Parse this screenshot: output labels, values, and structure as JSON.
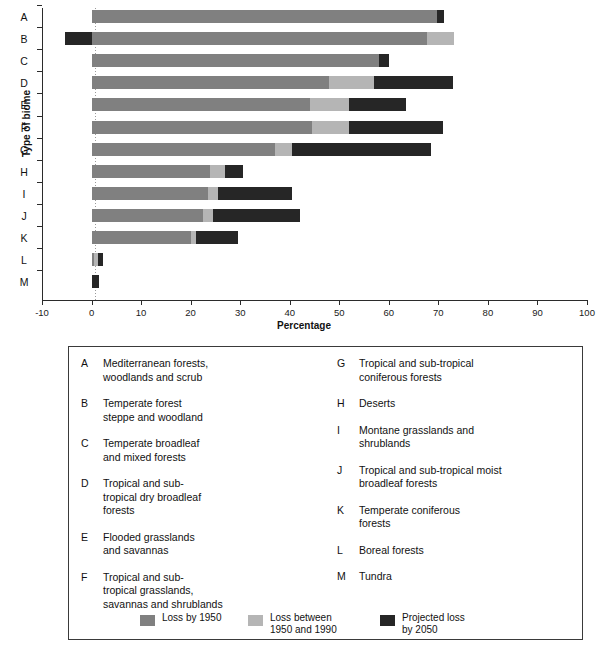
{
  "chart_data": {
    "type": "bar",
    "orientation": "horizontal",
    "stacked": true,
    "title": "",
    "xlabel": "Percentage",
    "ylabel": "Type of biome",
    "xlim": [
      -10,
      100
    ],
    "xticks": [
      -10,
      0,
      10,
      20,
      30,
      40,
      50,
      60,
      70,
      80,
      90,
      100
    ],
    "grid": false,
    "legend_position": "bottom",
    "categories": [
      "A",
      "B",
      "C",
      "D",
      "E",
      "F",
      "G",
      "H",
      "I",
      "J",
      "K",
      "L",
      "M"
    ],
    "series": [
      {
        "name": "Loss by 1950",
        "color": "#808080",
        "values": [
          69.8,
          67.8,
          58.0,
          48.0,
          44.0,
          44.5,
          37.0,
          24.0,
          23.5,
          22.5,
          20.0,
          0.5,
          0.0
        ]
      },
      {
        "name": "Loss between 1950 and 1990",
        "color": "#b5b5b5",
        "values": [
          0.0,
          5.4,
          0.0,
          9.0,
          8.0,
          7.5,
          3.5,
          3.0,
          2.0,
          2.0,
          1.0,
          0.8,
          0.0
        ]
      },
      {
        "name": "Projected loss by 2050",
        "color": "#262626",
        "values": [
          1.4,
          0.0,
          2.0,
          16.0,
          11.5,
          19.0,
          28.0,
          3.5,
          15.0,
          17.5,
          8.5,
          1.0,
          1.5
        ]
      }
    ],
    "negative_segments": [
      {
        "category": "B",
        "series": "Projected loss by 2050",
        "from": -5.3,
        "to": 0.0
      }
    ],
    "bar_totals": [
      71.2,
      73.2,
      60.0,
      73.0,
      63.5,
      71.0,
      68.5,
      30.5,
      40.5,
      42.0,
      29.5,
      2.3,
      1.5
    ]
  },
  "axis": {
    "ylabel": "Type of biome",
    "xlabel": "Percentage",
    "xticks": [
      "-10",
      "0",
      "10",
      "20",
      "30",
      "40",
      "50",
      "60",
      "70",
      "80",
      "90",
      "100"
    ],
    "ycategories": [
      "A",
      "B",
      "C",
      "D",
      "E",
      "F",
      "G",
      "H",
      "I",
      "J",
      "K",
      "L",
      "M"
    ]
  },
  "key": {
    "left_column": [
      {
        "letter": "A",
        "text": "Mediterranean forests,\nwoodlands and scrub"
      },
      {
        "letter": "B",
        "text": "Temperate forest\nsteppe and woodland"
      },
      {
        "letter": "C",
        "text": "Temperate broadleaf\nand mixed forests"
      },
      {
        "letter": "D",
        "text": "Tropical and sub-\ntropical dry broadleaf\nforests"
      },
      {
        "letter": "E",
        "text": "Flooded grasslands\nand savannas"
      },
      {
        "letter": "F",
        "text": "Tropical and sub-\ntropical grasslands,\nsavannas and shrublands"
      }
    ],
    "right_column": [
      {
        "letter": "G",
        "text": "Tropical and sub-tropical\nconiferous forests"
      },
      {
        "letter": "H",
        "text": "Deserts"
      },
      {
        "letter": "I",
        "text": "Montane grasslands and\nshrublands"
      },
      {
        "letter": "J",
        "text": "Tropical and sub-tropical moist\nbroadleaf forests"
      },
      {
        "letter": "K",
        "text": "Temperate coniferous\nforests"
      },
      {
        "letter": "L",
        "text": "Boreal forests"
      },
      {
        "letter": "M",
        "text": "Tundra"
      }
    ]
  },
  "legend": [
    {
      "label": "Loss by 1950",
      "color": "#808080"
    },
    {
      "label": "Loss between\n1950 and 1990",
      "color": "#b5b5b5"
    },
    {
      "label": "Projected loss\nby 2050",
      "color": "#262626"
    }
  ]
}
